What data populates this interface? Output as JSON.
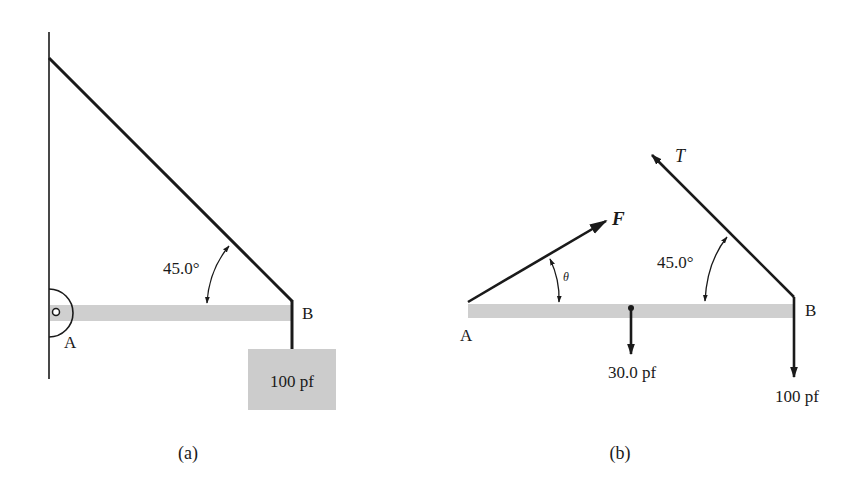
{
  "figure_a": {
    "caption": "(a)",
    "point_a_label": "A",
    "point_b_label": "B",
    "angle_label": "45.0°",
    "weight_box_label": "100 pf"
  },
  "figure_b": {
    "caption": "(b)",
    "point_a_label": "A",
    "point_b_label": "B",
    "tension_label": "T",
    "force_label": "F",
    "theta_label": "θ",
    "angle_label": "45.0°",
    "beam_weight_label": "30.0 pf",
    "load_label": "100 pf"
  },
  "colors": {
    "line": "#1a1a1a",
    "beam": "#cfcfcf",
    "box": "#cccccc",
    "background": "#ffffff"
  }
}
